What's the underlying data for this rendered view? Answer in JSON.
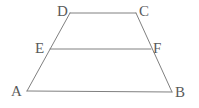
{
  "figure": {
    "name": "trapezoid-abcd-with-midsegment-ef",
    "background_color": "#ffffff",
    "stroke_color": "#808080",
    "label_color": "#5a5a5a",
    "stroke_width": 1,
    "width": 199,
    "height": 108,
    "vertices": [
      {
        "id": "A",
        "label": "A",
        "x": 27,
        "y": 91,
        "label_x": 11,
        "label_y": 84
      },
      {
        "id": "B",
        "label": "B",
        "x": 172,
        "y": 92,
        "label_x": 175,
        "label_y": 85
      },
      {
        "id": "C",
        "label": "C",
        "x": 136,
        "y": 13,
        "label_x": 139,
        "label_y": 4
      },
      {
        "id": "D",
        "label": "D",
        "x": 70,
        "y": 13,
        "label_x": 57,
        "label_y": 4
      },
      {
        "id": "E",
        "label": "E",
        "x": 50,
        "y": 49,
        "label_x": 35,
        "label_y": 41
      },
      {
        "id": "F",
        "label": "F",
        "x": 151,
        "y": 49,
        "label_x": 153,
        "label_y": 41
      }
    ],
    "segments": [
      {
        "name": "segment-ab",
        "from": "A",
        "to": "B"
      },
      {
        "name": "segment-dc",
        "from": "D",
        "to": "C"
      },
      {
        "name": "segment-ef",
        "from": "E",
        "to": "F"
      },
      {
        "name": "segment-ad",
        "from": "A",
        "to": "D"
      },
      {
        "name": "segment-bc",
        "from": "B",
        "to": "C"
      }
    ]
  }
}
